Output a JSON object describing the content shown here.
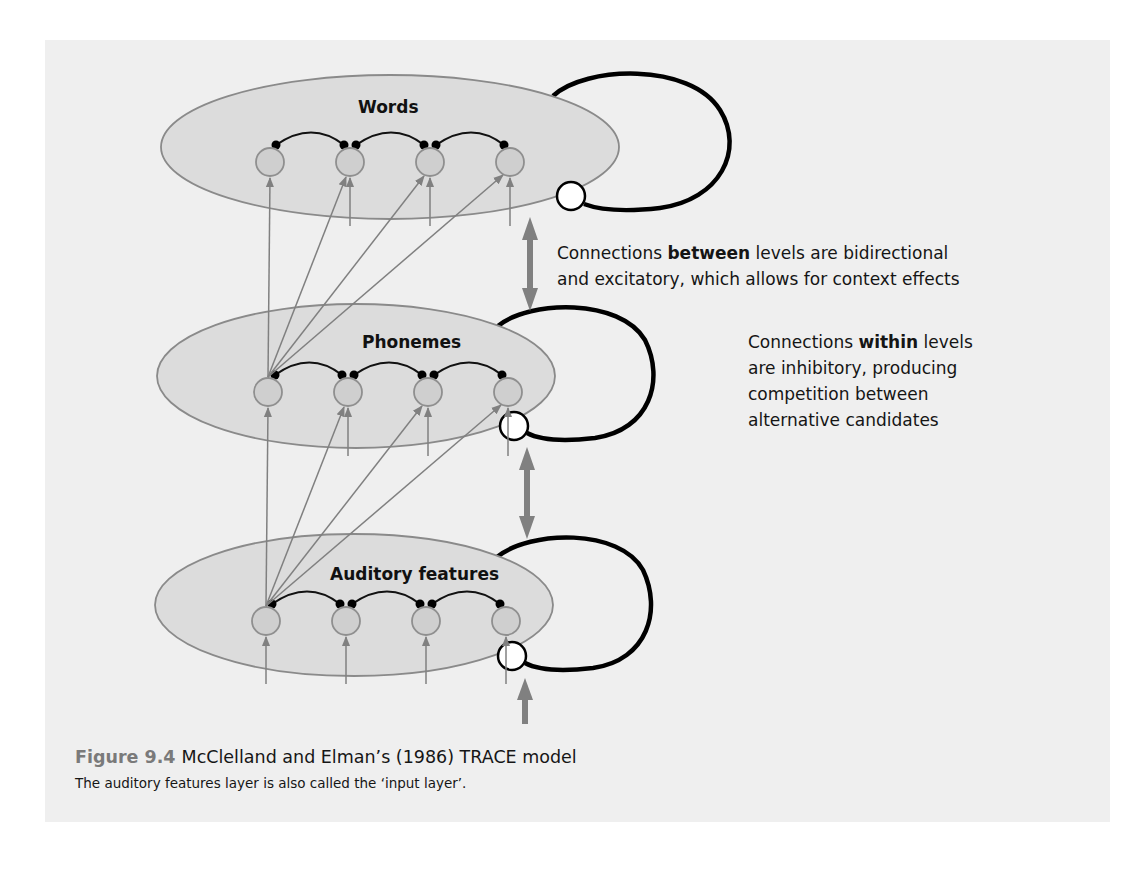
{
  "colors": {
    "page_background": "#ffffff",
    "panel_background": "#efefef",
    "layer_fill": "#dcdcdc",
    "layer_stroke": "#8a8a8a",
    "node_fill": "#cfcfcf",
    "node_stroke": "#8f8f8f",
    "excitatory_arrow": "#808080",
    "inhibitory_link": "#111111",
    "inhibitory_loop": "#000000",
    "caption_number": "#7a7a7a"
  },
  "layers": [
    {
      "id": "words",
      "label": "Words",
      "nodes": 4
    },
    {
      "id": "phonemes",
      "label": "Phonemes",
      "nodes": 4
    },
    {
      "id": "auditory",
      "label": "Auditory features",
      "nodes": 4
    }
  ],
  "annotations": {
    "between": {
      "prefix": "Connections ",
      "emphasis": "between",
      "line1_suffix": " levels are bidirectional",
      "line2": "and excitatory, which allows for context effects"
    },
    "within": {
      "prefix": "Connections ",
      "emphasis": "within",
      "line1_suffix": " levels",
      "line2": "are inhibitory, producing",
      "line3": "competition between",
      "line4": "alternative candidates"
    }
  },
  "caption": {
    "number": "Figure 9.4",
    "title": "McClelland and Elman’s (1986) TRACE model",
    "subtitle": "The auditory features layer is also called the ‘input layer’."
  }
}
